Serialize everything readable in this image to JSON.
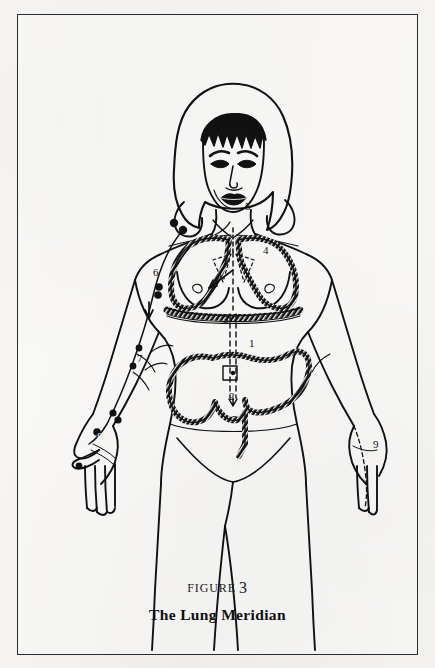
{
  "page": {
    "background_color": "#f5f4f2",
    "frame_color": "#2b2b2b",
    "ink_color": "#111111"
  },
  "caption": {
    "figure_word": "FIGURE",
    "figure_number": "3",
    "title": "The Lung Meridian"
  },
  "illustration": {
    "subject": "female-anatomical-figure-front-view",
    "description": "Line drawing of a standing woman, front view, with the lung meridian pathway traced down the left arm and internal organs outlined.",
    "organs": [
      "lungs",
      "trachea",
      "diaphragm",
      "large-intestine",
      "stomach"
    ],
    "meridian_flow": "downward-along-left-arm-to-thumb"
  },
  "labels": [
    {
      "id": "1",
      "text": "1",
      "x": 232,
      "y": 333,
      "region": "stomach"
    },
    {
      "id": "2",
      "text": "2",
      "x": 217,
      "y": 381,
      "region": "large-intestine-terminus"
    },
    {
      "id": "3",
      "text": "3",
      "x": 212,
      "y": 305,
      "region": "diaphragm"
    },
    {
      "id": "4",
      "text": "4",
      "x": 246,
      "y": 236,
      "region": "lung-right"
    },
    {
      "id": "5",
      "text": "5",
      "x": 227,
      "y": 190,
      "region": "throat-trachea"
    },
    {
      "id": "6",
      "text": "6",
      "x": 138,
      "y": 265,
      "region": "upper-arm"
    },
    {
      "id": "7",
      "text": "7",
      "x": 122,
      "y": 347,
      "region": "forearm"
    },
    {
      "id": "8",
      "text": "8",
      "x": 85,
      "y": 423,
      "region": "thumb"
    },
    {
      "id": "9",
      "text": "9",
      "x": 365,
      "y": 430,
      "region": "right-hand"
    }
  ],
  "acupoints": [
    {
      "x": 157,
      "y": 209
    },
    {
      "x": 166,
      "y": 216
    },
    {
      "x": 142,
      "y": 273
    },
    {
      "x": 141,
      "y": 281
    },
    {
      "x": 122,
      "y": 334
    },
    {
      "x": 116,
      "y": 352
    },
    {
      "x": 96,
      "y": 399
    },
    {
      "x": 101,
      "y": 406
    },
    {
      "x": 80,
      "y": 418
    }
  ]
}
